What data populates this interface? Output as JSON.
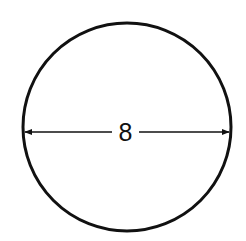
{
  "diagram": {
    "shape": "circle",
    "dimension": {
      "type": "diameter",
      "label": "8"
    },
    "colors": {
      "stroke": "#111111",
      "background": "#ffffff"
    }
  }
}
